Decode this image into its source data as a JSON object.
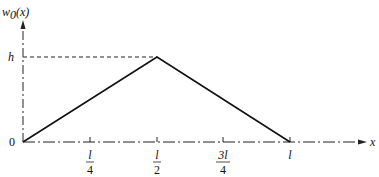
{
  "diagram": {
    "y_label": "w",
    "y_label_sub": "0",
    "y_label_arg": "(x)",
    "x_label": "x",
    "h_label": "h",
    "origin_label": "0",
    "ticks": [
      {
        "num": "l",
        "den": "4"
      },
      {
        "num": "l",
        "den": "2"
      },
      {
        "num": "3l",
        "den": "4"
      },
      {
        "num": "l",
        "den": ""
      }
    ],
    "shape": "triangle",
    "peak": {
      "x": "l/2",
      "y": "h"
    }
  }
}
